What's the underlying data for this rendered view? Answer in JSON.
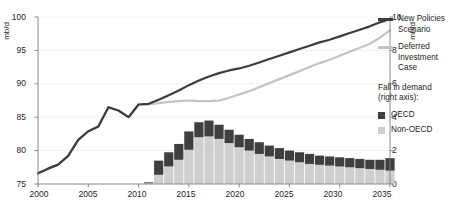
{
  "axes": {
    "left_unit": "mb/d",
    "right_unit": "mb/d",
    "left_ticks": [
      "100",
      "95",
      "90",
      "85",
      "80",
      "75"
    ],
    "right_ticks": [
      "10",
      "8",
      "6",
      "4",
      "2",
      "0"
    ],
    "x_ticks": [
      "2000",
      "2005",
      "2010",
      "2015",
      "2020",
      "2025",
      "2030",
      "2035"
    ]
  },
  "legend": {
    "series1": "New Policies Scenario",
    "series1_line1": "New Policies",
    "series1_line2": "Scenario",
    "series2_line1": "Deferred",
    "series2_line2": "Investment Case",
    "group_title_line1": "Fall in demand",
    "group_title_line2": "(right axis):",
    "bar1": "OECD",
    "bar2": "Non-OECD"
  },
  "colors": {
    "new_policies": "#3c3c3c",
    "deferred": "#c3c3c3",
    "oecd": "#3f3f3f",
    "non_oecd": "#cfcfcf",
    "grid": "#d8d8d8",
    "axis": "#808080",
    "text": "#231f20"
  },
  "chart_data": {
    "type": "line",
    "title": "",
    "xlabel": "",
    "ylabel": "mb/d",
    "y2label": "mb/d",
    "xlim": [
      2000,
      2035
    ],
    "ylim": [
      75,
      100
    ],
    "y2lim": [
      0,
      10
    ],
    "grid": true,
    "legend_position": "right",
    "x": [
      2000,
      2001,
      2002,
      2003,
      2004,
      2005,
      2006,
      2007,
      2008,
      2009,
      2010,
      2011,
      2012,
      2013,
      2014,
      2015,
      2016,
      2017,
      2018,
      2019,
      2020,
      2021,
      2022,
      2023,
      2024,
      2025,
      2026,
      2027,
      2028,
      2029,
      2030,
      2031,
      2032,
      2033,
      2034,
      2035
    ],
    "series": [
      {
        "name": "New Policies Scenario",
        "axis": "left",
        "values": [
          76.6,
          77.3,
          77.9,
          79.2,
          81.6,
          82.9,
          83.6,
          86.5,
          86.0,
          85.0,
          86.9,
          87.0,
          87.6,
          88.3,
          89.0,
          89.8,
          90.5,
          91.1,
          91.6,
          92.0,
          92.3,
          92.7,
          93.2,
          93.7,
          94.2,
          94.7,
          95.2,
          95.7,
          96.2,
          96.6,
          97.1,
          97.6,
          98.1,
          98.6,
          99.2,
          99.7
        ]
      },
      {
        "name": "Deferred Investment Case",
        "axis": "left",
        "values": [
          76.6,
          77.3,
          77.9,
          79.2,
          81.6,
          82.9,
          83.6,
          86.5,
          86.0,
          85.0,
          86.9,
          86.9,
          87.1,
          87.3,
          87.4,
          87.5,
          87.4,
          87.4,
          87.5,
          87.9,
          88.4,
          88.9,
          89.5,
          90.1,
          90.7,
          91.3,
          91.9,
          92.5,
          93.1,
          93.6,
          94.2,
          94.8,
          95.4,
          96.0,
          96.9,
          98.0
        ]
      }
    ],
    "bars": {
      "type": "stacked-bar",
      "axis": "right",
      "name": "Fall in demand",
      "years": [
        2011,
        2012,
        2013,
        2014,
        2015,
        2016,
        2017,
        2018,
        2019,
        2020,
        2021,
        2022,
        2023,
        2024,
        2025,
        2026,
        2027,
        2028,
        2029,
        2030,
        2031,
        2032,
        2033,
        2034,
        2035
      ],
      "categories": [
        "Non-OECD",
        "OECD"
      ],
      "non_oecd": [
        0.05,
        0.55,
        1.05,
        1.45,
        2.05,
        2.8,
        2.85,
        2.7,
        2.45,
        2.2,
        2.0,
        1.8,
        1.65,
        1.5,
        1.4,
        1.3,
        1.2,
        1.15,
        1.1,
        1.05,
        1.0,
        0.95,
        0.9,
        0.85,
        0.8
      ],
      "oecd": [
        0.05,
        0.85,
        0.85,
        0.95,
        1.1,
        0.9,
        0.95,
        0.85,
        0.8,
        0.75,
        0.7,
        0.7,
        0.65,
        0.65,
        0.6,
        0.6,
        0.6,
        0.55,
        0.55,
        0.55,
        0.55,
        0.55,
        0.55,
        0.6,
        0.75
      ],
      "totals": [
        0.1,
        1.4,
        1.9,
        2.4,
        3.15,
        3.7,
        3.8,
        3.55,
        3.25,
        2.95,
        2.7,
        2.5,
        2.3,
        2.15,
        2.0,
        1.9,
        1.8,
        1.7,
        1.65,
        1.6,
        1.55,
        1.5,
        1.45,
        1.45,
        1.55
      ]
    }
  }
}
